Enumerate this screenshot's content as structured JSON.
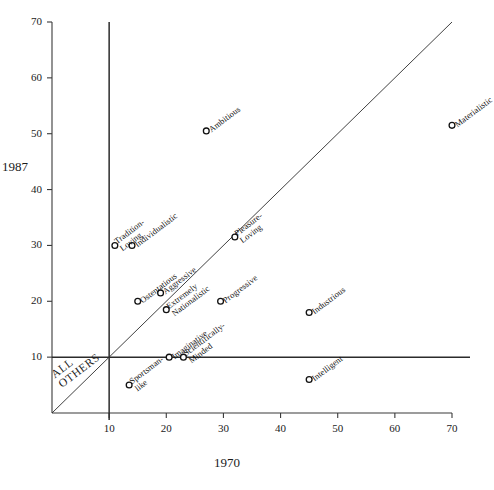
{
  "chart_data": {
    "type": "scatter",
    "title": "",
    "xlabel": "1970",
    "ylabel": "1987",
    "xlim": [
      0,
      70
    ],
    "ylim": [
      0,
      70
    ],
    "xticks": [
      10,
      20,
      30,
      40,
      50,
      60,
      70
    ],
    "yticks": [
      10,
      20,
      30,
      40,
      50,
      60,
      70
    ],
    "grid": false,
    "legend": null,
    "reference_lines": [
      {
        "name": "diagonal-identity-line",
        "type": "diagonal",
        "from": [
          0,
          0
        ],
        "to": [
          70,
          70
        ]
      },
      {
        "name": "vertical-threshold-line",
        "type": "vertical",
        "value": 10
      },
      {
        "name": "horizontal-threshold-line",
        "type": "horizontal",
        "value": 10
      }
    ],
    "annotations": [
      {
        "name": "all-others-quadrant-label",
        "text": "ALL\nOTHERS",
        "x": 3,
        "y": 5
      }
    ],
    "marker": "open-circle",
    "points": [
      {
        "label": "Tradition-\nLoving",
        "x": 11,
        "y": 30
      },
      {
        "label": "Individualistic",
        "x": 14,
        "y": 30
      },
      {
        "label": "Ostentatious",
        "x": 15,
        "y": 20
      },
      {
        "label": "Aggressive",
        "x": 19,
        "y": 21.5
      },
      {
        "label": "Extremely\nNationalistic",
        "x": 20,
        "y": 18.5
      },
      {
        "label": "Imaginative",
        "x": 20.5,
        "y": 10
      },
      {
        "label": "Scientifically-\nMinded",
        "x": 23,
        "y": 10
      },
      {
        "label": "Sportsman-\nlike",
        "x": 13.5,
        "y": 5
      },
      {
        "label": "Ambitious",
        "x": 27,
        "y": 50.5
      },
      {
        "label": "Progressive",
        "x": 29.5,
        "y": 20
      },
      {
        "label": "Pleasure-\nLoving",
        "x": 32,
        "y": 31.5
      },
      {
        "label": "Intelligent",
        "x": 45,
        "y": 6
      },
      {
        "label": "Industrious",
        "x": 45,
        "y": 18
      },
      {
        "label": "Materialistic",
        "x": 70,
        "y": 51.5
      }
    ]
  },
  "colors": {
    "axis": "#3a3a3a",
    "threshold_line": "#2b2b2b",
    "diagonal_line": "#2b2b2b",
    "marker_stroke": "#111111",
    "marker_fill": "#ffffff",
    "text": "#1a1a1a",
    "background": "#ffffff"
  }
}
